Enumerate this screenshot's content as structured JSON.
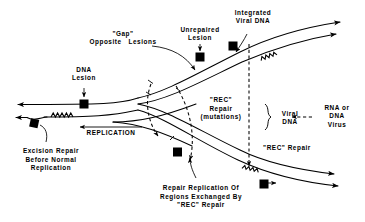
{
  "figure": {
    "type": "schematic-diagram",
    "background_color": "#ffffff",
    "stroke_color": "#000000",
    "marker_color": "#000000"
  },
  "labels": {
    "dna_lesion": "DNA\nLesion",
    "gap_opposite_lesions": "\"Gap\"\nOpposite   Lesions",
    "unrepaired_lesion": "Unrepaired\nLesion",
    "integrated_viral_dna": "Integrated\nViral DNA",
    "replication": "REPLICATION",
    "excision_repair": "Excision Repair\nBefore Normal\nReplication",
    "rec_repair_mutations": "\"REC\"\nRepair\n(mutations)",
    "viral_dna": "Viral\nDNA",
    "rna_or_dna_virus": "RNA or\nDNA\nVirus",
    "rec_repair_right": "\"REC\" Repair",
    "repair_replication": "Repair Replication Of\nRegions Exchanged By\n\"REC\" Repair"
  },
  "icons": {
    "lesion_marker": "filled-square-lesion-marker",
    "repair_patch": "zigzag-coil-repair-patch",
    "strand_arrow": "strand-direction-arrowhead",
    "dashed_arrow": "dashed-rec-repair-arrow",
    "brace": "curly-brace"
  },
  "markers": {
    "lesions": [
      {
        "name": "dna-lesion-left-strand",
        "x": 84,
        "y": 104
      },
      {
        "name": "excision-repair-lesion",
        "x": 34,
        "y": 125
      },
      {
        "name": "unrepaired-lesion-upper",
        "x": 200,
        "y": 57
      },
      {
        "name": "integrated-viral-dna-marker",
        "x": 262,
        "y": 42
      },
      {
        "name": "lower-fork-lesion",
        "x": 178,
        "y": 152
      },
      {
        "name": "lower-right-lesion",
        "x": 264,
        "y": 184
      }
    ],
    "repair_patches": [
      {
        "name": "excision-repair-patch",
        "x": 70,
        "y": 117
      },
      {
        "name": "upper-right-repair-patch",
        "x": 268,
        "y": 55
      },
      {
        "name": "lower-right-repair-patch",
        "x": 249,
        "y": 170
      }
    ]
  }
}
